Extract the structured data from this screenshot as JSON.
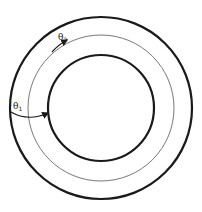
{
  "diagram": {
    "type": "concentric-circles",
    "circles": [
      {
        "name": "outer",
        "radius": 91,
        "stroke_width": 2.2,
        "color": "#1a1a1a"
      },
      {
        "name": "middle",
        "radius": 73,
        "stroke_width": 0.8,
        "color": "#555555"
      },
      {
        "name": "inner",
        "radius": 53,
        "stroke_width": 2.2,
        "color": "#1a1a1a"
      }
    ],
    "center": [
      101,
      108
    ],
    "labels": {
      "theta1": {
        "symbol": "θ",
        "subscript": "1"
      },
      "theta2": {
        "symbol": "θ",
        "subscript": "2"
      }
    },
    "arrows": [
      {
        "name": "theta1-arrow",
        "description": "from outer circle to inner circle, left side"
      },
      {
        "name": "theta2-arrow",
        "description": "along middle circle, upper-left"
      }
    ]
  }
}
